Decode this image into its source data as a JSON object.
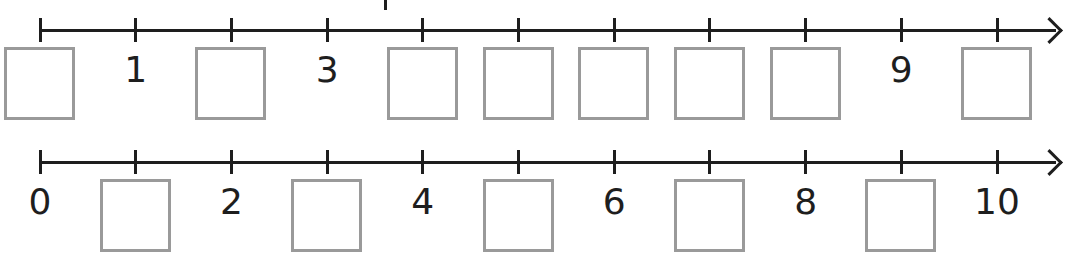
{
  "worksheet": {
    "colors": {
      "line": "#1e1e1e",
      "box_border": "#9a9a9a",
      "background": "#ffffff"
    },
    "number_lines": [
      {
        "id": "top",
        "axis_y": 30,
        "ticks": [
          0,
          1,
          2,
          3,
          4,
          5,
          6,
          7,
          8,
          9,
          10
        ],
        "labels": [
          {
            "value": 1,
            "text": "1"
          },
          {
            "value": 3,
            "text": "3"
          },
          {
            "value": 9,
            "text": "9"
          }
        ],
        "blank_boxes": [
          0,
          2,
          4,
          5,
          6,
          7,
          8,
          10
        ]
      },
      {
        "id": "bottom",
        "axis_y": 162,
        "ticks": [
          0,
          1,
          2,
          3,
          4,
          5,
          6,
          7,
          8,
          9,
          10
        ],
        "labels": [
          {
            "value": 0,
            "text": "0"
          },
          {
            "value": 2,
            "text": "2"
          },
          {
            "value": 4,
            "text": "4"
          },
          {
            "value": 6,
            "text": "6"
          },
          {
            "value": 8,
            "text": "8"
          },
          {
            "value": 10,
            "text": "10"
          }
        ],
        "blank_boxes": [
          1,
          3,
          5,
          7,
          9
        ]
      }
    ]
  }
}
